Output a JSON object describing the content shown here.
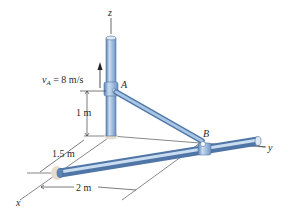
{
  "diagram": {
    "axes": {
      "z": "z",
      "y": "y",
      "x": "x"
    },
    "points": {
      "A": "A",
      "B": "B"
    },
    "velocity": {
      "symbol": "v",
      "subscript": "A",
      "rest": " = 8 m/s"
    },
    "dimensions": {
      "height_A": "1 m",
      "offset_x": "1.5 m",
      "offset_y": "2 m"
    },
    "colors": {
      "rod_fill": "#8fb3dc",
      "rod_edge": "#4f76a6",
      "rod_highlight": "#c9dcf0",
      "base_disk": "#e6ddd0",
      "line": "#444444"
    }
  }
}
